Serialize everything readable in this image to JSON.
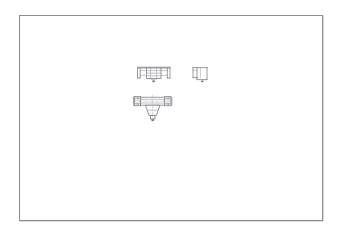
{
  "application": {
    "title": "CAD Drawing Viewport",
    "background_color": "#ffffff"
  },
  "sheet": {
    "name": "drawing-sheet",
    "border_color": "#8e8e92",
    "fill_color": "#ffffff",
    "shadow_color": "#b9b9bd",
    "x": 19,
    "y": 15,
    "width": 304,
    "height": 206
  },
  "drawing": {
    "line_color": "#7b7b80",
    "thin_line_color": "#9a9aa0",
    "hidden_line_color": "#a6a6ac",
    "center_line_color": "#a9a9af",
    "hatch_fill": "#ededf0",
    "subject": "flanged tee fitting",
    "projection": "third-angle orthographic",
    "views": [
      {
        "name": "top-plan-view",
        "label": "",
        "position": "upper-left",
        "description": "symmetric plan view with two outboard end flanges and a ladder-like central body"
      },
      {
        "name": "side-partial-view",
        "label": "",
        "position": "upper-right",
        "description": "narrow partial side view with single flange and body outline"
      },
      {
        "name": "front-section-view",
        "label": "",
        "position": "lower-center",
        "description": "front sectional view, horizontal run with two end flanges and a tapered branch stem below"
      }
    ]
  }
}
